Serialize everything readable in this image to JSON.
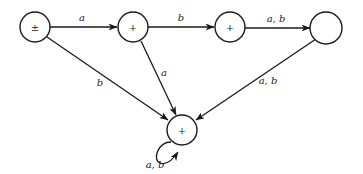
{
  "diagram": {
    "type": "finite-automaton",
    "states": [
      {
        "id": "q0",
        "label": "±",
        "x": 35,
        "y": 27
      },
      {
        "id": "q1",
        "label": "+",
        "x": 133,
        "y": 27
      },
      {
        "id": "q2",
        "label": "+",
        "x": 230,
        "y": 27
      },
      {
        "id": "q3",
        "label": "",
        "x": 326,
        "y": 28
      },
      {
        "id": "q4",
        "label": "+",
        "x": 182,
        "y": 130
      }
    ],
    "edges": [
      {
        "from": "q0",
        "to": "q1",
        "label": "a"
      },
      {
        "from": "q1",
        "to": "q2",
        "label": "b"
      },
      {
        "from": "q2",
        "to": "q3",
        "label": "a, b"
      },
      {
        "from": "q0",
        "to": "q4",
        "label": "b"
      },
      {
        "from": "q1",
        "to": "q4",
        "label": "a"
      },
      {
        "from": "q3",
        "to": "q4",
        "label": "a, b"
      },
      {
        "from": "q4",
        "to": "q4",
        "label": "a, b"
      }
    ]
  }
}
